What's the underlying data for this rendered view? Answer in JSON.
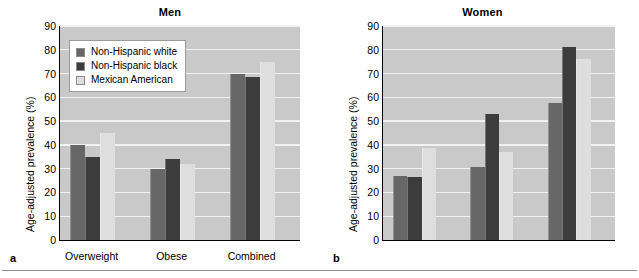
{
  "figure": {
    "bottom_rule": "horizontal-rule",
    "axis_ylabel": "Age-adjusted prevalence (%)",
    "y_ticks": [
      0,
      10,
      20,
      30,
      40,
      50,
      60,
      70,
      80,
      90
    ],
    "categories": [
      "Overweight",
      "Obese",
      "Combined"
    ],
    "series_names": [
      "Non-Hispanic white",
      "Non-Hispanic black",
      "Mexican American"
    ],
    "colors": {
      "non_hispanic_white": "#676767",
      "non_hispanic_black": "#3c3c3c",
      "mexican_american": "#dedede",
      "plot_background": "#c9c9c9",
      "gridline": "#f2f2f2",
      "axis": "#000000"
    }
  },
  "panels": [
    {
      "letter": "a",
      "title": "Men",
      "ylabel": "Age-adjusted prevalence (%)",
      "has_legend": true
    },
    {
      "letter": "b",
      "title": "Women",
      "ylabel": "Age-adjusted prevalence (%)",
      "has_legend": false
    }
  ],
  "chart_data": [
    {
      "type": "bar",
      "title": "Men",
      "panel_letter": "a",
      "xlabel": "",
      "ylabel": "Age-adjusted prevalence (%)",
      "ylim": [
        0,
        90
      ],
      "ytick_step": 10,
      "grid": true,
      "legend": "inside-upper-left",
      "categories": [
        "Overweight",
        "Obese",
        "Combined"
      ],
      "series": [
        {
          "name": "Non-Hispanic white",
          "values": [
            40,
            30,
            70
          ]
        },
        {
          "name": "Non-Hispanic black",
          "values": [
            35,
            34,
            68.5
          ]
        },
        {
          "name": "Mexican American",
          "values": [
            45,
            32,
            75
          ]
        }
      ]
    },
    {
      "type": "bar",
      "title": "Women",
      "panel_letter": "b",
      "xlabel": "",
      "ylabel": "Age-adjusted prevalence (%)",
      "ylim": [
        0,
        90
      ],
      "ytick_step": 10,
      "grid": true,
      "legend": "none",
      "categories": [
        "Overweight",
        "Obese",
        "Combined"
      ],
      "series": [
        {
          "name": "Non-Hispanic white",
          "values": [
            27,
            30.5,
            57.5
          ]
        },
        {
          "name": "Non-Hispanic black",
          "values": [
            26.5,
            53,
            81
          ]
        },
        {
          "name": "Mexican American",
          "values": [
            38.5,
            37,
            76
          ]
        }
      ]
    }
  ]
}
